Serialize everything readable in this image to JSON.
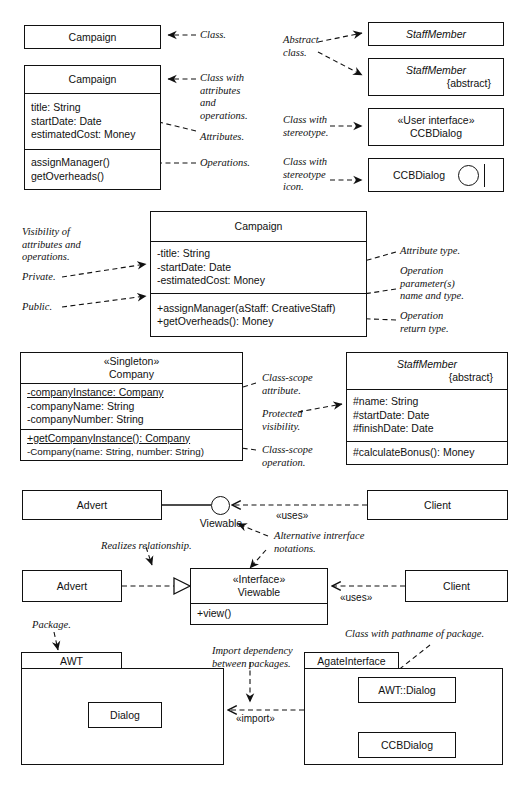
{
  "figure": {
    "type": "uml-class-diagram-notation-guide",
    "font_note": "class text sans-serif; annotations italic serif"
  },
  "section1": {
    "class_simple": {
      "name": "Campaign"
    },
    "class_full": {
      "name": "Campaign",
      "attributes": [
        "title: String",
        "startDate: Date",
        "estimatedCost: Money"
      ],
      "operations": [
        "assignManager()",
        "getOverheads()"
      ]
    },
    "annotations": {
      "class": "Class.",
      "class_with_attrs_ops": "Class with\nattributes\nand\noperations.",
      "attributes": "Attributes.",
      "operations": "Operations.",
      "abstract_class": "Abstract\nclass.",
      "class_with_stereotype": "Class with\nstereotype.",
      "class_with_stereotype_icon": "Class with\nstereotype\nicon."
    },
    "right_boxes": {
      "abstract_plain": {
        "name": "StaffMember"
      },
      "abstract_tagged": {
        "name": "StaffMember",
        "tag": "{abstract}"
      },
      "stereotyped": {
        "stereotype": "«User interface»",
        "name": "CCBDialog"
      },
      "stereotype_icon": {
        "name": "CCBDialog",
        "icon": "interface-lollipop-icon"
      }
    }
  },
  "section2": {
    "class_box": {
      "name": "Campaign",
      "attributes": [
        "-title: String",
        "-startDate: Date",
        "-estimatedCost: Money"
      ],
      "operations": [
        "+assignManager(aStaff: CreativeStaff)",
        "+getOverheads(): Money"
      ]
    },
    "annotations": {
      "visibility": "Visibility of\nattributes and\noperations.",
      "private": "Private.",
      "public": "Public.",
      "attribute_type": "Attribute type.",
      "operation_params": "Operation\nparameter(s)\nname and type.",
      "operation_return": "Operation\nreturn type."
    }
  },
  "section3": {
    "company": {
      "stereotype": "«Singleton»",
      "name": "Company",
      "attributes": [
        "-companyInstance: Company",
        "-companyName: String",
        "-companyNumber: String"
      ],
      "operations": [
        "+getCompanyInstance(): Company",
        "-Company(name: String, number: String)"
      ]
    },
    "staff_member": {
      "name": "StaffMember",
      "tag": "{abstract}",
      "attributes": [
        "#name: String",
        "#startDate: Date",
        "#finishDate: Date"
      ],
      "operations": [
        "#calculateBonus(): Money"
      ]
    },
    "annotations": {
      "class_scope_attribute": "Class-scope\nattribute.",
      "protected_visibility": "Protected\nvisibility.",
      "class_scope_operation": "Class-scope\noperation."
    }
  },
  "section4": {
    "advert_top": {
      "name": "Advert"
    },
    "client_top": {
      "name": "Client"
    },
    "lollipop_label": "Viewable",
    "uses_top": "«uses»",
    "advert_bottom": {
      "name": "Advert"
    },
    "interface_box": {
      "stereotype": "«Interface»",
      "name": "Viewable",
      "operations": [
        "+view()"
      ]
    },
    "client_bottom": {
      "name": "Client"
    },
    "uses_bottom": "«uses»",
    "annotations": {
      "realizes": "Realizes relationship.",
      "alternative_notations": "Alternative intrerface\nnotations."
    }
  },
  "section5": {
    "awt_package": {
      "name": "AWT",
      "contents": [
        {
          "name": "Dialog"
        }
      ]
    },
    "agate_package": {
      "name": "AgateInterface",
      "contents": [
        {
          "name": "AWT::Dialog"
        },
        {
          "name": "CCBDialog"
        }
      ]
    },
    "import_label": "«import»",
    "annotations": {
      "package": "Package.",
      "import_dependency": "Import dependency\nbetween packages.",
      "class_with_pathname": "Class with pathname of package."
    }
  }
}
